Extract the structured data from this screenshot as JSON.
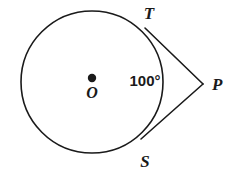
{
  "figure": {
    "kind": "circle-with-two-tangents",
    "background_color": "#ffffff",
    "stroke_color": "#1a1a1a",
    "circle": {
      "center_label": "O",
      "center_x": 92,
      "center_y": 82,
      "radius": 71,
      "center_dot_radius": 4.2
    },
    "points": {
      "tangent_top": {
        "label": "T",
        "x": 145,
        "y": 28,
        "label_x": 149,
        "label_y": 19
      },
      "tangent_bottom": {
        "label": "S",
        "x": 141,
        "y": 139,
        "label_x": 145,
        "label_y": 167
      },
      "external": {
        "label": "P",
        "x": 203,
        "y": 84,
        "label_x": 212,
        "label_y": 90
      },
      "center": {
        "label": "O",
        "x": 92,
        "y": 78,
        "label_x": 92,
        "label_y": 98
      }
    },
    "angle": {
      "value": "100°",
      "label_x": 145,
      "label_y": 86,
      "font_size": 15
    },
    "label_font_size": 17
  }
}
